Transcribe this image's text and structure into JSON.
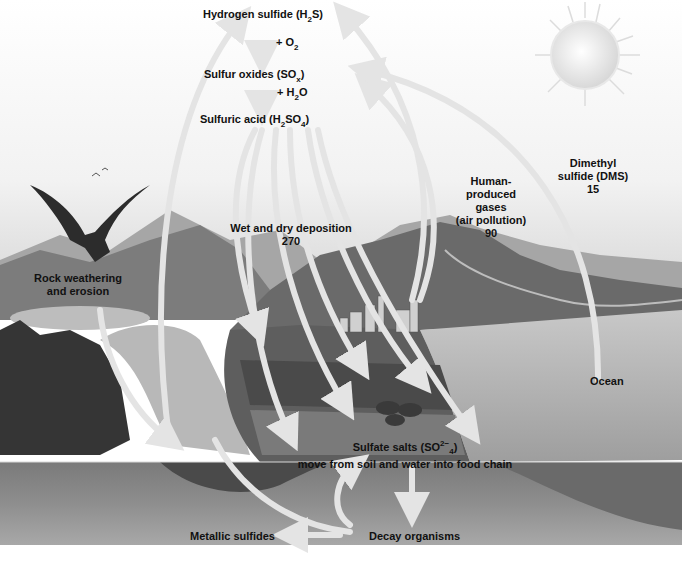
{
  "diagram": {
    "colors": {
      "sky_top": "#ffffff",
      "sky_horizon": "#d8d8d8",
      "mountain_far": "#9a9a9a",
      "mountain_near": "#6e6e6e",
      "forest": "#3a3a3a",
      "water": "#b4b4b4",
      "soil": "#8c8c8c",
      "soil_dark": "#707070",
      "arrow": "#e6e6e6",
      "text": "#111111"
    },
    "atmosphere": {
      "hydrogen_sulfide": "Hydrogen sulfide (H",
      "hydrogen_sulfide_sub": "2",
      "hydrogen_sulfide_end": "S)",
      "plus_o2": "+ O",
      "plus_o2_sub": "2",
      "sulfur_oxides": "Sulfur oxides (SO",
      "sulfur_oxides_sub": "x",
      "sulfur_oxides_end": ")",
      "plus_h2o_a": "+ H",
      "plus_h2o_sub": "2",
      "plus_h2o_b": "O",
      "sulfuric_acid": "Sulfuric acid (H",
      "sulfuric_acid_sub1": "2",
      "sulfuric_acid_mid": "SO",
      "sulfuric_acid_sub2": "4",
      "sulfuric_acid_end": ")"
    },
    "flows": {
      "dms_line1": "Dimethyl",
      "dms_line2": "sulfide (DMS)",
      "dms_value": "15",
      "human_line1": "Human-",
      "human_line2": "produced",
      "human_line3": "gases",
      "human_line4": "(air pollution)",
      "human_value": "90",
      "deposition_label": "Wet and dry deposition",
      "deposition_value": "270",
      "rock_line1": "Rock weathering",
      "rock_line2": "and erosion"
    },
    "surface": {
      "ocean": "Ocean",
      "sulfate_a": "Sulfate salts (SO",
      "sulfate_sup": "2−",
      "sulfate_sub": "4",
      "sulfate_b": ")",
      "sulfate_line2": "move from soil and water into food chain",
      "metallic_sulfides": "Metallic sulfides",
      "decay_organisms": "Decay organisms"
    }
  }
}
